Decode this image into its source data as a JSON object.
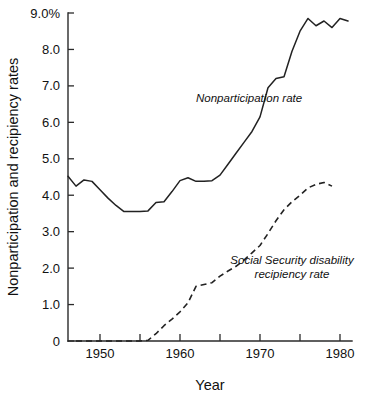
{
  "chart_data": {
    "type": "line",
    "title": "",
    "xlabel": "Year",
    "ylabel": "Nonparticipation and recipiency rates",
    "xlim": [
      1946,
      1981.5
    ],
    "ylim": [
      0,
      9.0
    ],
    "grid": false,
    "legend_position": "inline-annotations",
    "y_tick_labels": [
      "9.0%",
      "8.0",
      "7.0",
      "6.0",
      "5.0",
      "4.0",
      "3.0",
      "2.0",
      "1.0",
      "0"
    ],
    "y_tick_values": [
      9.0,
      8.0,
      7.0,
      6.0,
      5.0,
      4.0,
      3.0,
      2.0,
      1.0,
      0
    ],
    "x_tick_labels": [
      "1950",
      "1960",
      "1970",
      "1980"
    ],
    "x_tick_values": [
      1950,
      1960,
      1970,
      1980
    ],
    "x_minor_tick_values": [
      1950,
      1955,
      1960,
      1965,
      1970,
      1975,
      1980
    ],
    "annotations": [
      {
        "name": "nonparticipation-rate-label",
        "text": "Nonparticipation rate",
        "x": 1962.0,
        "y": 6.55
      },
      {
        "name": "recipiency-rate-label-line1",
        "text": "Social Security disability",
        "x": 1974.0,
        "y": 2.1
      },
      {
        "name": "recipiency-rate-label-line2",
        "text": "recipiency rate",
        "x": 1974.0,
        "y": 1.72
      }
    ],
    "series": [
      {
        "name": "Nonparticipation rate",
        "style": "solid",
        "color": "#222222",
        "x": [
          1946,
          1947,
          1948,
          1949,
          1950,
          1951,
          1952,
          1953,
          1954,
          1955,
          1956,
          1957,
          1958,
          1959,
          1960,
          1961,
          1962,
          1963,
          1964,
          1965,
          1966,
          1967,
          1968,
          1969,
          1970,
          1971,
          1972,
          1973,
          1974,
          1975,
          1976,
          1977,
          1978,
          1979,
          1980,
          1981
        ],
        "values": [
          4.52,
          4.25,
          4.42,
          4.38,
          4.15,
          3.92,
          3.72,
          3.55,
          3.55,
          3.55,
          3.57,
          3.8,
          3.82,
          4.1,
          4.4,
          4.48,
          4.38,
          4.38,
          4.4,
          4.55,
          4.85,
          5.15,
          5.45,
          5.75,
          6.15,
          6.95,
          7.2,
          7.25,
          7.95,
          8.5,
          8.85,
          8.65,
          8.78,
          8.6,
          8.85,
          8.78
        ]
      },
      {
        "name": "Social Security disability recipiency rate",
        "style": "dashed",
        "color": "#222222",
        "x": [
          1947,
          1948,
          1949,
          1950,
          1951,
          1952,
          1953,
          1954,
          1955,
          1956,
          1957,
          1958,
          1959,
          1960,
          1961,
          1962,
          1963,
          1964,
          1965,
          1966,
          1967,
          1968,
          1969,
          1970,
          1971,
          1972,
          1973,
          1974,
          1975,
          1976,
          1977,
          1978,
          1979
        ],
        "values": [
          0.0,
          0.0,
          0.0,
          0.0,
          0.0,
          0.0,
          0.0,
          0.0,
          0.0,
          0.02,
          0.2,
          0.42,
          0.6,
          0.8,
          1.05,
          1.5,
          1.55,
          1.6,
          1.78,
          1.92,
          2.05,
          2.22,
          2.42,
          2.62,
          2.95,
          3.3,
          3.6,
          3.82,
          4.0,
          4.2,
          4.3,
          4.35,
          4.25
        ]
      }
    ]
  },
  "figure": {
    "background_color": "#ffffff",
    "ink_color": "#222222"
  }
}
